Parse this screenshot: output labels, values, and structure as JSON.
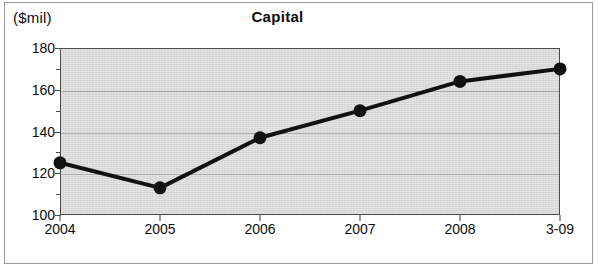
{
  "chart_data": {
    "type": "line",
    "title": "Capital",
    "unit_label": "($mil)",
    "xlabel": "",
    "ylabel": "",
    "categories": [
      "2004",
      "2005",
      "2006",
      "2007",
      "2008",
      "3-09"
    ],
    "values": [
      125,
      113,
      137,
      150,
      164,
      170
    ],
    "series": [
      {
        "name": "Capital",
        "values": [
          125,
          113,
          137,
          150,
          164,
          170
        ]
      }
    ],
    "ylim": [
      100,
      180
    ],
    "ytick_labels": [
      "100",
      "120",
      "140",
      "160",
      "180"
    ],
    "ytick_values": [
      100,
      120,
      140,
      160,
      180
    ],
    "yminor_values": [
      110,
      130,
      150,
      170
    ],
    "grid": true,
    "legend": "none",
    "marker": "circle",
    "line_color": "#111111",
    "marker_color": "#111111",
    "plot_background": "#d6d6d6",
    "grid_color": "#a7a7a7",
    "axis_color": "#4a4a4a"
  }
}
